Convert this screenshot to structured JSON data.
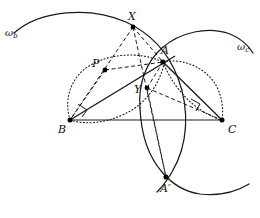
{
  "figure": {
    "width": 260,
    "height": 218,
    "background_color": "#ffffff",
    "stroke_color": "#1a1a1a",
    "point_color": "#000000"
  },
  "labels": {
    "omega_b": "ω",
    "omega_b_sub": "b",
    "omega_c": "ω",
    "omega_c_sub": "c",
    "X": "X",
    "A": "A",
    "P": "P",
    "Y": "Y",
    "B": "B",
    "C": "C",
    "A_prime": "A′"
  },
  "points": {
    "X": {
      "label": "X",
      "x": 133,
      "y": 27,
      "label_x": 128,
      "label_y": 12
    },
    "A": {
      "label": "A",
      "x": 163,
      "y": 62,
      "label_x": 160,
      "label_y": 45
    },
    "P": {
      "label": "P",
      "x": 105,
      "y": 70,
      "label_x": 93,
      "label_y": 60
    },
    "Y": {
      "label": "Y",
      "x": 147,
      "y": 88,
      "label_x": 134,
      "label_y": 92
    },
    "B": {
      "label": "B",
      "x": 70,
      "y": 120,
      "label_x": 58,
      "label_y": 126
    },
    "C": {
      "label": "C",
      "x": 222,
      "y": 120,
      "label_x": 227,
      "label_y": 126
    },
    "A_prime": {
      "label": "A′",
      "x": 166,
      "y": 177,
      "label_x": 160,
      "label_y": 183
    }
  },
  "arc_labels": {
    "omega_b_x": 5,
    "omega_b_y": 28,
    "omega_c_x": 237,
    "omega_c_y": 42
  },
  "segments": {
    "solid": [
      {
        "name": "segment-BC",
        "from": "B",
        "to": "C"
      },
      {
        "name": "segment-BA-extended",
        "from": "B",
        "to": "A"
      },
      {
        "name": "segment-AC",
        "from": "A",
        "to": "C"
      }
    ],
    "dashed": [
      {
        "name": "segment-XB",
        "from": "X",
        "to": "B"
      },
      {
        "name": "segment-XA",
        "from": "X",
        "to": "A"
      },
      {
        "name": "segment-XAprime",
        "from": "X",
        "to": "A_prime"
      },
      {
        "name": "segment-PB",
        "from": "P",
        "to": "B"
      },
      {
        "name": "segment-PA",
        "from": "P",
        "to": "A"
      },
      {
        "name": "segment-YC",
        "from": "Y",
        "to": "C"
      },
      {
        "name": "segment-AY",
        "from": "A",
        "to": "Y"
      }
    ]
  },
  "right_angle_marks": [
    {
      "name": "right-angle-mark-B",
      "x": 83,
      "y": 107
    },
    {
      "name": "right-angle-mark-C",
      "x": 196,
      "y": 104
    }
  ],
  "curves": {
    "omega_b": "solid circular arc through X, A and A′, bulging to the upper left",
    "omega_c": "solid circular arc through A and A′, bulging to the upper right",
    "dotted_left": "dotted circle through B, P and A",
    "dotted_right": "dotted circle through A and C"
  }
}
